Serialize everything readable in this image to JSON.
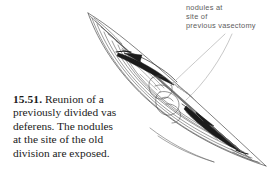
{
  "figure": {
    "number": "15.51.",
    "caption_lines": [
      "Reunion of a",
      "previously divided vas",
      "deferens. The nodules",
      "at the site of the old",
      "division are exposed."
    ],
    "caption_full": "15.51. Reunion of a previously divided vas deferens. The nodules at the site of the old division are exposed."
  },
  "annotation": {
    "lines": [
      "nodules at",
      "site of",
      "previous vasectomy"
    ],
    "full_text": "nodules at site of previous vasectomy",
    "color": "#5d5d5d"
  },
  "illustration": {
    "subject": "surgical-incision-vas-deferens",
    "description": "Line drawing of an opened scrotal incision exposing the vas deferens with nodules at the old vasectomy site",
    "line_color": "#3c3c3c",
    "fill_color": "#1c1c1c",
    "background": "#ffffff",
    "parts": [
      "wound-outline",
      "wound-edge-layers",
      "vas-deferens-upper-segment",
      "vas-deferens-lower-segment",
      "nodule-cluster",
      "hatching-shadow"
    ]
  },
  "leaders": {
    "count": 2,
    "color": "#8a8a8a"
  }
}
